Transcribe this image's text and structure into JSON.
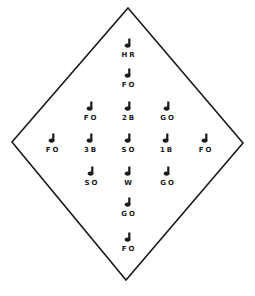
{
  "diagram": {
    "shape": "diamond",
    "vertices": {
      "top": [
        128,
        8
      ],
      "right": [
        243,
        143
      ],
      "bottom": [
        126,
        280
      ],
      "left": [
        12,
        142
      ]
    },
    "line_color": "#1a1a1a",
    "icon_glyph": "player-marker",
    "players": [
      {
        "label": "HR",
        "x": 128,
        "y": 38
      },
      {
        "label": "FO",
        "x": 128,
        "y": 68
      },
      {
        "label": "FO",
        "x": 90,
        "y": 101
      },
      {
        "label": "2B",
        "x": 128,
        "y": 101
      },
      {
        "label": "GO",
        "x": 167,
        "y": 101
      },
      {
        "label": "FO",
        "x": 52,
        "y": 133
      },
      {
        "label": "3B",
        "x": 90,
        "y": 133
      },
      {
        "label": "SO",
        "x": 128,
        "y": 133
      },
      {
        "label": "1B",
        "x": 166,
        "y": 133
      },
      {
        "label": "FO",
        "x": 205,
        "y": 133
      },
      {
        "label": "SO",
        "x": 91,
        "y": 166
      },
      {
        "label": "W",
        "x": 128,
        "y": 166
      },
      {
        "label": "GO",
        "x": 167,
        "y": 166
      },
      {
        "label": "GO",
        "x": 128,
        "y": 197
      },
      {
        "label": "FO",
        "x": 128,
        "y": 232
      }
    ]
  }
}
